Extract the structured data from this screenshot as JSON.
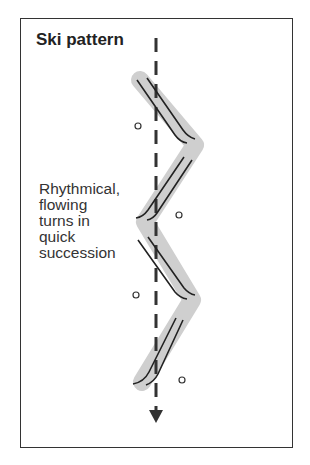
{
  "title": "Ski pattern",
  "caption_lines": [
    "Rhythmical,",
    "flowing",
    "turns in",
    "quick",
    "succession"
  ],
  "colors": {
    "track": "#222222",
    "band": "#cccccc",
    "fall_line": "#333333",
    "border": "#333333"
  },
  "icons": {
    "arrow": "arrow-down-icon",
    "gate": "circle-marker-icon"
  }
}
